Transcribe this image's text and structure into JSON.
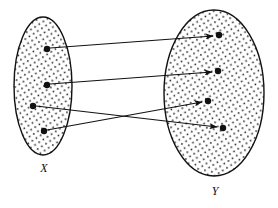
{
  "figure": {
    "caption_visible": false,
    "background_color": "#ffffff",
    "stroke_color": "#111111",
    "fill_pattern": "stipple-dots",
    "fill_base_color": "#ffffff",
    "dot_color": "#111111"
  },
  "sets": [
    {
      "id": "set-x",
      "label": "X",
      "label_x": 44,
      "label_y": 172,
      "cx": 43,
      "cy": 86,
      "rx": 29,
      "ry": 69,
      "elements": [
        {
          "id": "x1",
          "cx": 47,
          "cy": 49
        },
        {
          "id": "x2",
          "cx": 47,
          "cy": 85
        },
        {
          "id": "x3",
          "cx": 33,
          "cy": 106
        },
        {
          "id": "x4",
          "cx": 44,
          "cy": 131
        }
      ]
    },
    {
      "id": "set-y",
      "label": "Y",
      "label_x": 215,
      "label_y": 195,
      "cx": 214,
      "cy": 93,
      "rx": 50,
      "ry": 83,
      "elements": [
        {
          "id": "y1",
          "cx": 219,
          "cy": 35
        },
        {
          "id": "y2",
          "cx": 218,
          "cy": 71
        },
        {
          "id": "y3",
          "cx": 208,
          "cy": 101
        },
        {
          "id": "y4",
          "cx": 223,
          "cy": 128
        }
      ]
    }
  ],
  "arrows": [
    {
      "id": "arrow-x1-y1",
      "from": "x1",
      "to": "y1",
      "x1": 50,
      "y1": 48,
      "x2": 213,
      "y2": 36
    },
    {
      "id": "arrow-x2-y2",
      "from": "x2",
      "to": "y2",
      "x1": 50,
      "y1": 84,
      "x2": 212,
      "y2": 72
    },
    {
      "id": "arrow-x3-y4",
      "from": "x3",
      "to": "y4",
      "x1": 36,
      "y1": 106,
      "x2": 217,
      "y2": 127
    },
    {
      "id": "arrow-x4-y3",
      "from": "x4",
      "to": "y3",
      "x1": 47,
      "y1": 130,
      "x2": 202,
      "y2": 102
    }
  ],
  "geometry": {
    "point_radius": 3.2,
    "ellipse_stroke_width": 1.4,
    "arrow_stroke_width": 1.1,
    "arrowhead_length": 7,
    "arrowhead_width": 5
  }
}
